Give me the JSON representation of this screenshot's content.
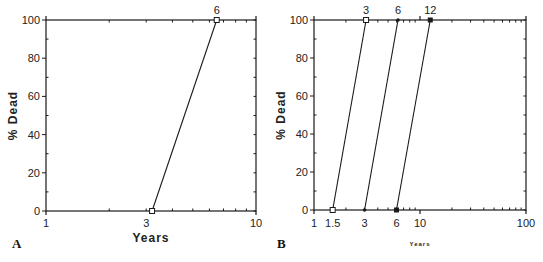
{
  "chart_data": [
    {
      "panel": "A",
      "type": "line",
      "xscale": "log",
      "xlim": [
        1,
        10
      ],
      "ylim": [
        0,
        100
      ],
      "xlabel": "Years",
      "ylabel": "% Dead",
      "xticks": [
        1,
        3,
        10
      ],
      "xtick_labels": [
        "1",
        "3",
        "10"
      ],
      "yticks": [
        0,
        20,
        40,
        60,
        80,
        100
      ],
      "ytick_labels": [
        "0",
        "20",
        "40",
        "60",
        "80",
        "100"
      ],
      "grid": false,
      "series": [
        {
          "name": "6",
          "marker": "open-square",
          "x": [
            3.2,
            6.5
          ],
          "y": [
            0,
            100
          ],
          "label": "6"
        }
      ]
    },
    {
      "panel": "B",
      "type": "line",
      "xscale": "log",
      "xlim": [
        1,
        100
      ],
      "ylim": [
        0,
        100
      ],
      "xlabel": "Years",
      "ylabel": "% Dead",
      "xticks": [
        1,
        1.5,
        3,
        6,
        10,
        100
      ],
      "xtick_labels": [
        "1",
        "1.5",
        "3",
        "6",
        "10",
        "100"
      ],
      "yticks": [
        0,
        20,
        40,
        60,
        80,
        100
      ],
      "ytick_labels": [
        "0",
        "20",
        "40",
        "60",
        "80",
        "100"
      ],
      "grid": false,
      "series": [
        {
          "name": "3",
          "marker": "open-square",
          "x": [
            1.5,
            3.1
          ],
          "y": [
            0,
            100
          ],
          "label": "3"
        },
        {
          "name": "6",
          "marker": "filled-dot",
          "x": [
            3.0,
            6.2
          ],
          "y": [
            0,
            100
          ],
          "label": "6"
        },
        {
          "name": "12",
          "marker": "filled-square",
          "x": [
            6.0,
            12.5
          ],
          "y": [
            0,
            100
          ],
          "label": "12"
        }
      ]
    }
  ],
  "panels": {
    "a": {
      "letter": "A",
      "xlabel": "Years",
      "ylabel": "% Dead"
    },
    "b": {
      "letter": "B",
      "xlabel": "Years",
      "ylabel": "% Dead"
    }
  },
  "colors": {
    "ink": "#1a1a1a",
    "background": "#ffffff"
  }
}
